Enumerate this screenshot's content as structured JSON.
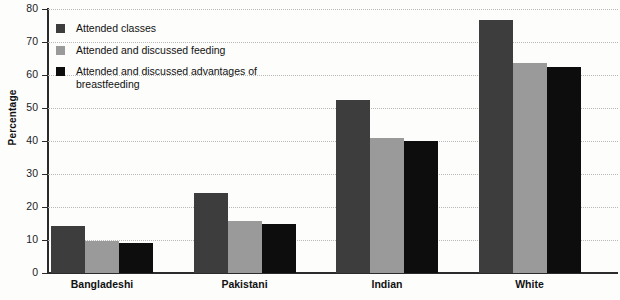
{
  "chart_data": {
    "type": "bar",
    "title": "",
    "xlabel": "",
    "ylabel": "Percentage",
    "ylim": [
      0,
      80
    ],
    "yticks": [
      0,
      10,
      20,
      30,
      40,
      50,
      60,
      70,
      80
    ],
    "grid": true,
    "legend_position": "upper-left-inside",
    "categories": [
      "Bangladeshi",
      "Pakistani",
      "Indian",
      "White"
    ],
    "series": [
      {
        "name": "Attended classes",
        "color": "#3d3d3d",
        "values": [
          14,
          24,
          52.5,
          76.8
        ]
      },
      {
        "name": "Attended and discussed feeding",
        "color": "#9a9a9a",
        "values": [
          9.5,
          15.7,
          40.7,
          63.7
        ]
      },
      {
        "name": "Attended and discussed advantages of breastfeeding",
        "color": "#0d0d0d",
        "values": [
          9,
          14.8,
          40,
          62.3
        ]
      }
    ]
  },
  "colors": {
    "background": "#fdfdfc",
    "axis": "#2b2b2b",
    "gridline": "#b9b9b9",
    "text": "#111111"
  }
}
